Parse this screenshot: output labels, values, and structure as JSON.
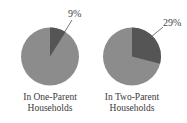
{
  "chart_data": [
    {
      "type": "pie",
      "title": "In One-Parent Households",
      "title_lines": [
        "In One-Parent",
        "Households"
      ],
      "slices": [
        {
          "label": "highlighted",
          "value": 9,
          "color": "#555555"
        },
        {
          "label": "other",
          "value": 91,
          "color": "#8c8c8c"
        }
      ],
      "annotation": "9%"
    },
    {
      "type": "pie",
      "title": "In Two-Parent Households",
      "title_lines": [
        "In Two-Parent",
        "Households"
      ],
      "slices": [
        {
          "label": "highlighted",
          "value": 29,
          "color": "#555555"
        },
        {
          "label": "other",
          "value": 71,
          "color": "#8c8c8c"
        }
      ],
      "annotation": "29%"
    }
  ]
}
